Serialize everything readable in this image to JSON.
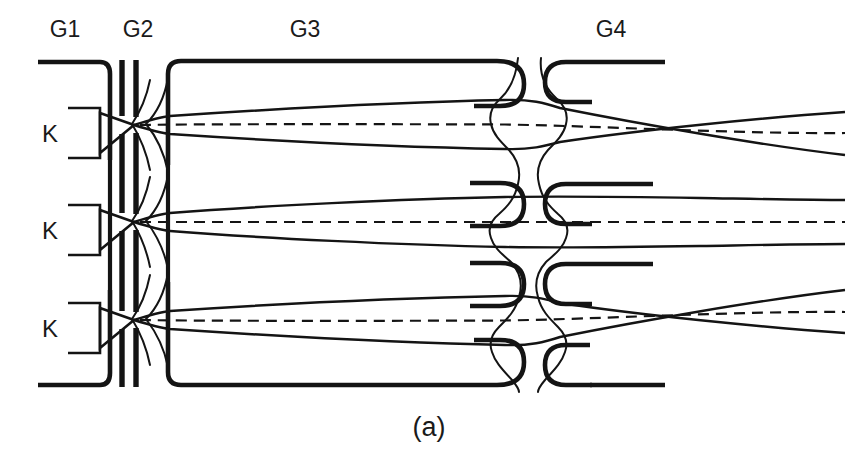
{
  "figure": {
    "caption": "(a)",
    "background_color": "#ffffff",
    "line_color": "#141414",
    "width": 858,
    "height": 456
  },
  "electrode_labels": [
    {
      "name": "G1",
      "text": "G1",
      "x": 65,
      "y": 35
    },
    {
      "name": "G2",
      "text": "G2",
      "x": 138,
      "y": 35
    },
    {
      "name": "G3",
      "text": "G3",
      "x": 305,
      "y": 35
    },
    {
      "name": "G4",
      "text": "G4",
      "x": 611,
      "y": 35
    }
  ],
  "cathode_labels": [
    {
      "name": "K",
      "text": "K",
      "x": 50,
      "y": 133
    },
    {
      "name": "K",
      "text": "K",
      "x": 50,
      "y": 230
    },
    {
      "name": "K",
      "text": "K",
      "x": 50,
      "y": 328
    }
  ],
  "beams": [
    {
      "id": "top-beam",
      "axis_y_start": 125,
      "axis_y_end": 143,
      "convergence": "downward",
      "crossover_x": 134
    },
    {
      "id": "center-beam",
      "axis_y_start": 222,
      "axis_y_end": 222,
      "convergence": "straight",
      "crossover_x": 134
    },
    {
      "id": "bottom-beam",
      "axis_y_start": 320,
      "axis_y_end": 302,
      "convergence": "upward",
      "crossover_x": 134
    }
  ],
  "geometry": {
    "g1_left": 38,
    "g1_right": 110,
    "g2_bar1_x": 122,
    "g2_bar2_x": 134,
    "g3_left": 165,
    "g3_right": 528,
    "g4_left": 545,
    "g4_right": 665,
    "frame_top": 60,
    "frame_bottom": 385,
    "field_line_1_x": 505,
    "field_line_2_x": 553,
    "beam_exit_x": 845
  },
  "colors": {
    "stroke": "#141414",
    "text": "#1a1a1a",
    "background": "#ffffff"
  }
}
